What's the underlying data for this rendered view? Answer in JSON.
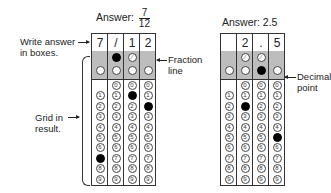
{
  "left": {
    "title_prefix": "Answer:",
    "fraction": {
      "numerator": "7",
      "denominator": "12"
    },
    "header_cells": [
      "7",
      "/",
      "1",
      "2"
    ],
    "filled": {
      "col1": "7",
      "col2": "/",
      "col3": "1",
      "col4": "2"
    },
    "labels": {
      "write_answer": [
        "Write answer",
        "in boxes."
      ],
      "fraction_line": [
        "Fraction",
        "line"
      ],
      "grid_in": [
        "Grid in",
        "result."
      ]
    }
  },
  "right": {
    "title": "Answer: 2.5",
    "header_cells": [
      "",
      "2",
      ".",
      "5"
    ],
    "filled": {
      "col2": "2",
      "col3": ".",
      "col4": "5"
    },
    "labels": {
      "decimal_point": [
        "Decimal",
        "point"
      ]
    }
  },
  "digits": [
    "0",
    "1",
    "2",
    "3",
    "4",
    "5",
    "6",
    "7",
    "8",
    "9"
  ],
  "colors": {
    "shaded_zone": "#bdbdbd",
    "filled_bubble": "#000000",
    "border": "#333333"
  }
}
